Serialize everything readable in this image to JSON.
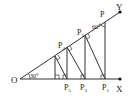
{
  "diagram": {
    "type": "geometry",
    "points": {
      "O": {
        "label": "O",
        "x": 20,
        "y": 79
      },
      "X": {
        "label": "X",
        "x": 120,
        "y": 79
      },
      "Y": {
        "label": "Y",
        "x": 120,
        "y": 12
      },
      "P": {
        "label": "P",
        "x": 105,
        "y": 20
      },
      "P1": {
        "label": "P",
        "sub": "1",
        "x": 105,
        "y": 79
      },
      "P2": {
        "label": "P",
        "sub": "2",
        "x": 86,
        "y": 36
      },
      "P3": {
        "label": "P",
        "sub": "3",
        "x": 83,
        "y": 79
      },
      "P4": {
        "label": "P",
        "sub": "4",
        "x": 68,
        "y": 51
      },
      "P5": {
        "label": "P",
        "sub": "5",
        "x": 68,
        "y": 79
      }
    },
    "angles": {
      "angle_O": "30°",
      "angle_P": "60°"
    }
  }
}
